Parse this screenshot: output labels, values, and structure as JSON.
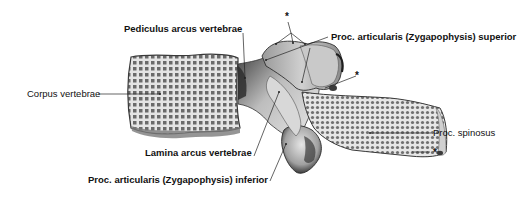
{
  "figure": {
    "colors": {
      "bone_light": "#d9d9d9",
      "bone_mid": "#a8a8a8",
      "bone_dark": "#4a4a4a",
      "leader_line": "#222222",
      "text": "#111111",
      "background": "#ffffff"
    }
  },
  "labels": {
    "pediculus": "Pediculus arcus vertebrae",
    "proc_art_sup": "Proc. articularis (Zygapophysis) superior",
    "corpus": "Corpus vertebrae",
    "lamina": "Lamina arcus vertebrae",
    "proc_art_inf": "Proc. articularis (Zygapophysis) inferior",
    "proc_spinosus": "Proc. spinosus",
    "star_top": "*",
    "star_mid": "*",
    "star_right": "*"
  }
}
